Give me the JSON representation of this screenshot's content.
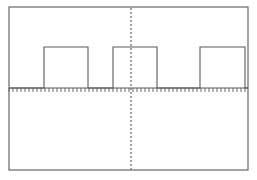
{
  "chart_data": {
    "type": "line",
    "title": "",
    "subtitle": "",
    "xlabel": "",
    "ylabel": "",
    "legend": [],
    "annotations": [],
    "grid": false,
    "xlim": [
      0,
      257
    ],
    "ylim": [
      0,
      1
    ],
    "baseline_value": 0,
    "high_value": 1,
    "waveform": {
      "series_name": "pulse-train",
      "shape": "rectangular-pulse",
      "pulse_count": 3,
      "duty_cycle_percent": 50,
      "x": [
        9,
        44,
        44,
        88,
        88,
        113,
        113,
        157,
        157,
        200,
        200,
        245,
        245,
        248
      ],
      "y": [
        0,
        0,
        1,
        1,
        0,
        0,
        1,
        1,
        0,
        0,
        1,
        1,
        0,
        0
      ],
      "pulse_spans": [
        {
          "start": 44,
          "end": 88
        },
        {
          "start": 113,
          "end": 157
        },
        {
          "start": 200,
          "end": 245
        }
      ]
    },
    "axis": {
      "baseline_y": 88,
      "x_start": 9,
      "x_end": 248,
      "tick_count": 60,
      "tick_spacing": 4,
      "tick_length": 4,
      "tick_direction": "down"
    },
    "center_reference_line": {
      "x": 131,
      "style": "dashed",
      "dash": 2,
      "gap": 2,
      "y_start": 8,
      "y_end": 170
    },
    "frame": {
      "left": 9,
      "top": 7,
      "right": 248,
      "bottom": 170
    },
    "colors": {
      "background": "#ffffff",
      "frame": "#5a5a5a",
      "trace": "#5a5a5a",
      "axis": "#5a5a5a",
      "ticks": "#6a6a6a",
      "center_line": "#8a8a8a"
    }
  }
}
